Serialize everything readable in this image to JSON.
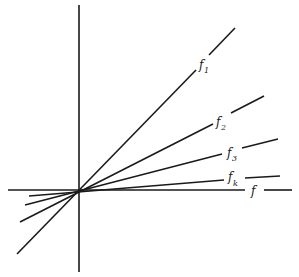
{
  "diagram": {
    "type": "line-fan through origin",
    "axes": {
      "horizontal_label": "f",
      "vertical_label": ""
    },
    "lines": [
      {
        "id": "f1",
        "label_base": "f",
        "label_sub": "1"
      },
      {
        "id": "f2",
        "label_base": "f",
        "label_sub": "2"
      },
      {
        "id": "f3",
        "label_base": "f",
        "label_sub": "3"
      },
      {
        "id": "fk",
        "label_base": "f",
        "label_sub": "k"
      }
    ],
    "colors": {
      "ink": "#1a1a1a",
      "background": "#ffffff"
    }
  }
}
